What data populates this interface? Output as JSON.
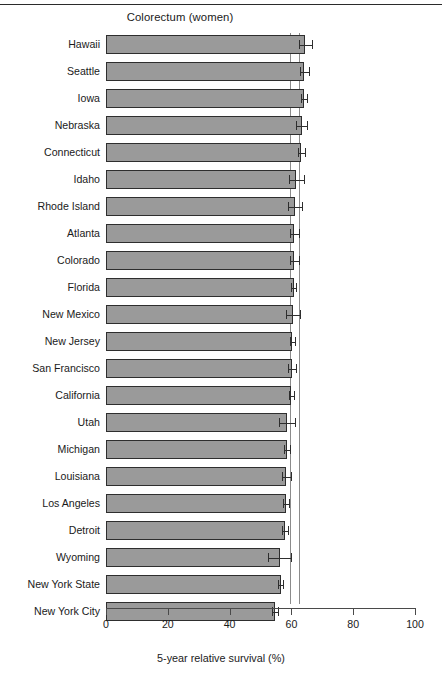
{
  "chart_data": {
    "type": "bar",
    "orientation": "horizontal",
    "title": "Colorectum (women)",
    "xlabel": "5-year relative survival  (%)",
    "ylabel": "",
    "xlim": [
      0,
      100
    ],
    "xticks": [
      0,
      20,
      40,
      60,
      80,
      100
    ],
    "xticklabels": [
      "0",
      "20",
      "40",
      "60",
      "80",
      "100"
    ],
    "grid": false,
    "legend": null,
    "reference_lines": [
      59.5,
      62.3
    ],
    "categories": [
      "Hawaii",
      "Seattle",
      "Iowa",
      "Nebraska",
      "Connecticut",
      "Idaho",
      "Rhode Island",
      "Atlanta",
      "Colorado",
      "Florida",
      "New Mexico",
      "New Jersey",
      "San Francisco",
      "California",
      "Utah",
      "Michigan",
      "Louisiana",
      "Los Angeles",
      "Detroit",
      "Wyoming",
      "New York State",
      "New York City"
    ],
    "values": [
      64.5,
      64.2,
      64.0,
      63.3,
      63.2,
      61.6,
      61.2,
      61.0,
      60.9,
      60.7,
      60.6,
      60.3,
      60.2,
      60.0,
      58.6,
      58.6,
      58.4,
      58.3,
      58.0,
      56.2,
      56.6,
      54.6
    ],
    "error_low": [
      62.3,
      62.8,
      63.0,
      61.5,
      62.0,
      59.1,
      59.0,
      59.5,
      59.4,
      59.8,
      58.4,
      59.4,
      59.0,
      59.2,
      55.9,
      57.7,
      56.9,
      57.3,
      57.0,
      52.5,
      55.8,
      53.6
    ],
    "error_high": [
      66.8,
      65.6,
      65.0,
      65.1,
      64.4,
      64.1,
      63.4,
      62.5,
      62.4,
      61.6,
      62.8,
      61.2,
      61.4,
      60.8,
      61.3,
      59.5,
      59.9,
      59.3,
      59.0,
      59.9,
      57.4,
      55.6
    ]
  },
  "colors": {
    "bar_fill": "#9a9a9a",
    "bar_edge": "#2e2e2e",
    "reference_line": "#8c8c8c",
    "axis": "#4a4a4a",
    "text": "#1a1a1a",
    "background": "#ffffff"
  }
}
